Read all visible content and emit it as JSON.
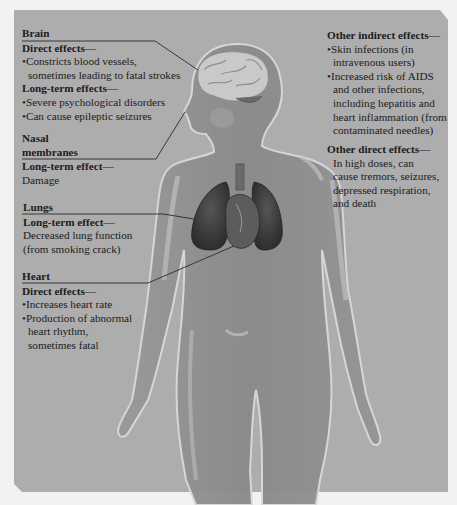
{
  "diagram": {
    "topic": "Effects of cocaine on the body",
    "colors": {
      "panel": "#adadad",
      "body": "#8f8f8f",
      "body_highlight": "#c4c4c4",
      "organ_dark": "#4a4a4a",
      "text": "#1c1c1c",
      "page": "#f2f2f2"
    },
    "callouts": {
      "brain": {
        "title": "Brain",
        "direct_heading": "Direct effects—",
        "direct_items": [
          "•Constricts blood vessels,",
          "sometimes leading to fatal strokes"
        ],
        "longterm_heading": "Long-term effects—",
        "longterm_items": [
          "•Severe psychological disorders",
          "•Can cause epileptic seizures"
        ]
      },
      "nasal": {
        "title_line1": "Nasal",
        "title_line2": "membranes",
        "longterm_heading": "Long-term effect—",
        "longterm_text": "Damage"
      },
      "lungs": {
        "title": "Lungs",
        "longterm_heading": "Long-term effect—",
        "longterm_lines": [
          "Decreased lung function",
          "(from smoking crack)"
        ]
      },
      "heart": {
        "title": "Heart",
        "direct_heading": "Direct effects—",
        "direct_lines": [
          "•Increases heart rate",
          "•Production of abnormal",
          "heart rhythm,",
          "sometimes fatal"
        ]
      },
      "other_indirect": {
        "heading": "Other indirect effects—",
        "lines": [
          "•Skin infections (in",
          "intravenous users)",
          "•Increased risk of AIDS",
          "and other infections,",
          "including hepatitis and",
          "heart inflammation (from",
          "contaminated needles)"
        ]
      },
      "other_direct": {
        "heading": "Other direct effects—",
        "lines": [
          "In high doses, can",
          "cause tremors, seizures,",
          "depressed respiration,",
          "and death"
        ]
      }
    }
  }
}
